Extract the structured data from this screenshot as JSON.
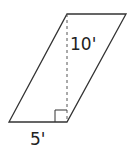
{
  "diagram": {
    "shape": "parallelogram",
    "height_label": "10'",
    "base_label": "5'",
    "stroke_color": "#333333",
    "vertices": {
      "top_left": [
        67,
        14
      ],
      "top_right": [
        126,
        14
      ],
      "bottom_right": [
        67,
        122
      ],
      "bottom_left": [
        9,
        122
      ]
    },
    "height_line": "dashed",
    "right_angle_marker": true
  }
}
